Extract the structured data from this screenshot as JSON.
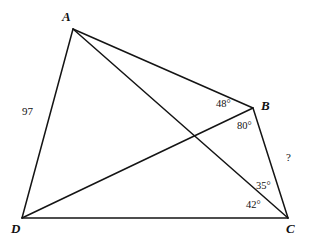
{
  "figure": {
    "kind": "geometry-diagram",
    "background_color": "#ffffff",
    "line_color": "#141414",
    "text_color": "#111111",
    "width": 311,
    "height": 251
  },
  "vertices": [
    {
      "name": "A",
      "label": "A",
      "x": 73,
      "y": 29,
      "label_x": 62,
      "label_y": 10
    },
    {
      "name": "B",
      "label": "B",
      "x": 253,
      "y": 108,
      "label_x": 261,
      "label_y": 99
    },
    {
      "name": "C",
      "label": "C",
      "x": 288,
      "y": 218,
      "label_x": 286,
      "label_y": 222
    },
    {
      "name": "D",
      "label": "D",
      "x": 22,
      "y": 218,
      "label_x": 11,
      "label_y": 222
    }
  ],
  "edges": [
    {
      "name": "AB",
      "from": "A",
      "to": "B",
      "x1": 73,
      "y1": 29,
      "x2": 253,
      "y2": 108
    },
    {
      "name": "BC",
      "from": "B",
      "to": "C",
      "x1": 253,
      "y1": 108,
      "x2": 288,
      "y2": 218
    },
    {
      "name": "CD",
      "from": "C",
      "to": "D",
      "x1": 288,
      "y1": 218,
      "x2": 22,
      "y2": 218
    },
    {
      "name": "DA",
      "from": "D",
      "to": "A",
      "x1": 22,
      "y1": 218,
      "x2": 73,
      "y2": 29
    }
  ],
  "diagonals": [
    {
      "name": "AC",
      "from": "A",
      "to": "C",
      "x1": 73,
      "y1": 29,
      "x2": 288,
      "y2": 218
    },
    {
      "name": "DB",
      "from": "D",
      "to": "B",
      "x1": 22,
      "y1": 218,
      "x2": 253,
      "y2": 108
    }
  ],
  "annotations": {
    "side_length_AD": {
      "text": "97",
      "x": 22,
      "y": 106
    },
    "angle_ABD": {
      "text": "48°",
      "x": 216,
      "y": 99
    },
    "angle_DBC": {
      "text": "80°",
      "x": 237,
      "y": 121
    },
    "side_BC_unknown": {
      "text": "?",
      "x": 286,
      "y": 152
    },
    "angle_ACB": {
      "text": "35°",
      "x": 256,
      "y": 181
    },
    "angle_DCA": {
      "text": "42°",
      "x": 246,
      "y": 200
    }
  }
}
